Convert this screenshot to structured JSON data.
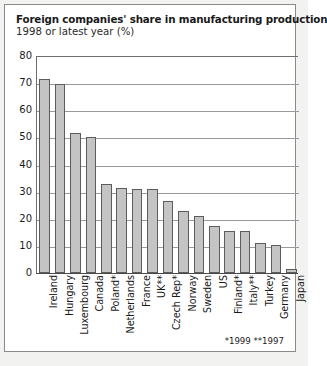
{
  "title": "Foreign companies' share in manufacturing production",
  "subtitle": "1998 or latest year (%)",
  "footnote": "*1999 **1997",
  "colors": {
    "bar_fill": "#c4c4c4",
    "bar_stroke": "#5c5c5c",
    "grid": "#9a9a9a",
    "frame": "#8a8a8a",
    "page_background": "#f2f2f0",
    "plot_background": "#ffffff",
    "text": "#1a1a1a"
  },
  "chart_data": {
    "type": "bar",
    "title": "Foreign companies' share in manufacturing production",
    "subtitle": "1998 or latest year (%)",
    "xlabel": "",
    "ylabel": "",
    "ylim": [
      0,
      80
    ],
    "yticks": [
      0,
      10,
      20,
      30,
      40,
      50,
      60,
      70,
      80
    ],
    "ytick_labels": [
      "0",
      "10",
      "20",
      "30",
      "40",
      "50",
      "60",
      "70",
      "80"
    ],
    "grid": true,
    "legend": false,
    "annotations": [
      "*1999 **1997"
    ],
    "categories": [
      "Ireland",
      "Hungary",
      "Luxembourg",
      "Canada",
      "Poland*",
      "Netherlands",
      "France",
      "UK**",
      "Czech Rep*",
      "Norway",
      "Sweden",
      "US",
      "Finland*",
      "Italy**",
      "Turkey",
      "Germany",
      "Japan"
    ],
    "values": [
      71.5,
      69.5,
      51.5,
      50.0,
      33.0,
      31.5,
      31.0,
      31.0,
      26.5,
      23.0,
      21.0,
      17.5,
      15.5,
      15.5,
      11.0,
      10.5,
      1.5
    ]
  }
}
